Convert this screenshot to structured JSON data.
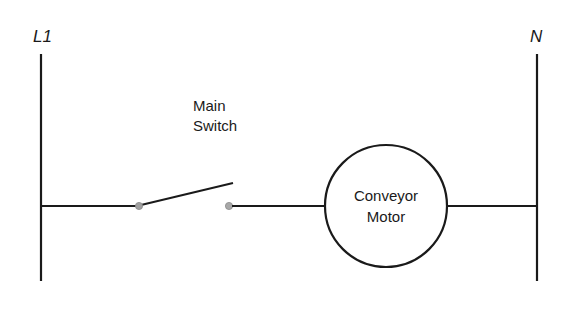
{
  "diagram": {
    "type": "ladder-logic",
    "rails": {
      "left": {
        "label": "L1"
      },
      "right": {
        "label": "N"
      }
    },
    "rungs": [
      {
        "components": [
          {
            "kind": "switch-normally-open",
            "label_lines": [
              "Main",
              "Switch"
            ]
          },
          {
            "kind": "motor",
            "label_lines": [
              "Conveyor",
              "Motor"
            ]
          }
        ]
      }
    ],
    "colors": {
      "line": "#1a1a1a",
      "contact_terminal": "#9a9a9a",
      "background": "#ffffff"
    }
  }
}
